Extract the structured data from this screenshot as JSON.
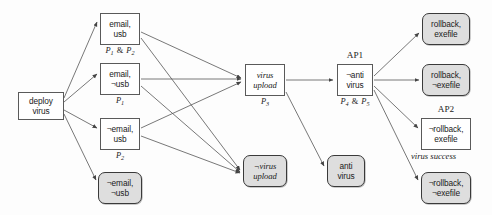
{
  "diagram": {
    "colors": {
      "node_border": "#5a5a5a",
      "shaded_fill": "#dedede",
      "shaded_border": "#3a3a3a",
      "edge": "#555555",
      "background": "#fdfdfd"
    },
    "nodes": [
      {
        "id": "deploy",
        "line1": "deploy",
        "line2": "virus",
        "style": "plain",
        "x": 18,
        "y": 92,
        "w": 46,
        "h": 28
      },
      {
        "id": "email_usb",
        "line1": "email,",
        "line2": "usb",
        "style": "plain",
        "x": 100,
        "y": 13,
        "w": 40,
        "h": 32
      },
      {
        "id": "email_nusb",
        "line1": "email,",
        "line2": "¬usb",
        "style": "plain",
        "x": 100,
        "y": 63,
        "w": 40,
        "h": 32
      },
      {
        "id": "nemail_usb",
        "line1": "¬email,",
        "line2": "usb",
        "style": "plain",
        "x": 100,
        "y": 118,
        "w": 40,
        "h": 32
      },
      {
        "id": "nemail_nusb",
        "line1": "¬email,",
        "line2": "¬usb",
        "style": "shaded",
        "x": 98,
        "y": 172,
        "w": 44,
        "h": 32
      },
      {
        "id": "virus_upload",
        "line1": "virus",
        "line2": "upload",
        "style": "italic",
        "x": 245,
        "y": 64,
        "w": 40,
        "h": 32
      },
      {
        "id": "nvirus_upload",
        "line1": "¬virus",
        "line2": "upload",
        "style": "shaded-italic",
        "x": 243,
        "y": 155,
        "w": 44,
        "h": 32
      },
      {
        "id": "anti_virus",
        "line1": "anti",
        "line2": "virus",
        "style": "shaded",
        "x": 327,
        "y": 155,
        "w": 38,
        "h": 32
      },
      {
        "id": "nanti_virus",
        "line1": "¬anti",
        "line2": "virus",
        "style": "plain",
        "x": 337,
        "y": 64,
        "w": 36,
        "h": 32
      },
      {
        "id": "rb_exe",
        "line1": "rollback,",
        "line2": "exefile",
        "style": "shaded",
        "x": 422,
        "y": 13,
        "w": 48,
        "h": 32
      },
      {
        "id": "rb_nexe",
        "line1": "rollback,",
        "line2": "¬exefile",
        "style": "shaded",
        "x": 422,
        "y": 64,
        "w": 48,
        "h": 32
      },
      {
        "id": "nrb_exe",
        "line1": "¬rollback,",
        "line2": "exefile",
        "style": "plain",
        "x": 421,
        "y": 118,
        "w": 50,
        "h": 32
      },
      {
        "id": "nrb_nexe",
        "line1": "¬rollback,",
        "line2": "¬exefile",
        "style": "shaded",
        "x": 421,
        "y": 172,
        "w": 50,
        "h": 32
      }
    ],
    "sublabels": [
      {
        "id": "p1_and_p2",
        "text": "P₁ & P₂",
        "p_first": "P",
        "sub_first": "1",
        "amp": "&",
        "p_second": "P",
        "sub_second": "2",
        "x": 100,
        "y": 46,
        "w": 40
      },
      {
        "id": "p1",
        "text": "P₁",
        "p_first": "P",
        "sub_first": "1",
        "x": 100,
        "y": 96,
        "w": 40
      },
      {
        "id": "p2",
        "text": "P₂",
        "p_first": "P",
        "sub_first": "2",
        "x": 100,
        "y": 151,
        "w": 40
      },
      {
        "id": "p3",
        "text": "P₃",
        "p_first": "P",
        "sub_first": "3",
        "x": 245,
        "y": 97,
        "w": 40
      },
      {
        "id": "p4_and_p5",
        "text": "P₄ & P₅",
        "p_first": "P",
        "sub_first": "4",
        "amp": "&",
        "p_second": "P",
        "sub_second": "5",
        "x": 327,
        "y": 97,
        "w": 56
      }
    ],
    "toplabels": [
      {
        "id": "ap1",
        "text": "AP1",
        "x": 337,
        "y": 50,
        "w": 36
      },
      {
        "id": "ap2",
        "text": "AP2",
        "x": 421,
        "y": 104,
        "w": 50
      }
    ],
    "captions": [
      {
        "id": "virus_success",
        "text": "virus success",
        "x": 411,
        "y": 151
      }
    ],
    "edges": [
      {
        "from": "deploy",
        "to": "email_usb",
        "path": "M 64,98 L 97,22"
      },
      {
        "from": "deploy",
        "to": "email_nusb",
        "path": "M 64,102 L 97,74"
      },
      {
        "from": "deploy",
        "to": "nemail_usb",
        "path": "M 64,110 L 97,128"
      },
      {
        "from": "deploy",
        "to": "nemail_nusb",
        "path": "M 64,114 L 96,180"
      },
      {
        "from": "email_usb",
        "to": "virus_upload",
        "path": "M 141,32 L 241,78"
      },
      {
        "from": "email_usb",
        "to": "nvirus_upload",
        "path": "M 141,38 L 240,170"
      },
      {
        "from": "email_nusb",
        "to": "virus_upload",
        "path": "M 141,79 L 241,79"
      },
      {
        "from": "email_nusb",
        "to": "nvirus_upload",
        "path": "M 141,86 L 240,172"
      },
      {
        "from": "nemail_usb",
        "to": "virus_upload",
        "path": "M 141,128 L 241,82"
      },
      {
        "from": "nemail_usb",
        "to": "nvirus_upload",
        "path": "M 141,136 L 240,173"
      },
      {
        "from": "virus_upload",
        "to": "nanti_virus",
        "path": "M 286,80 L 333,80"
      },
      {
        "from": "virus_upload",
        "to": "anti_virus",
        "path": "M 286,92 L 324,166"
      },
      {
        "from": "nanti_virus",
        "to": "rb_exe",
        "path": "M 374,76 L 419,33"
      },
      {
        "from": "nanti_virus",
        "to": "rb_nexe",
        "path": "M 374,80 L 419,80"
      },
      {
        "from": "nanti_virus",
        "to": "nrb_exe",
        "path": "M 374,86 L 418,128"
      },
      {
        "from": "nanti_virus",
        "to": "nrb_nexe",
        "path": "M 374,90 L 418,180"
      }
    ]
  }
}
